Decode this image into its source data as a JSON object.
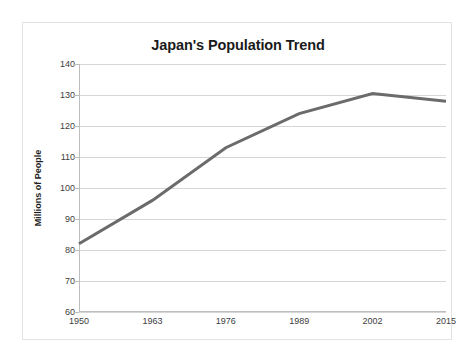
{
  "chart_data": {
    "type": "line",
    "title": "Japan's Population Trend",
    "xlabel": "",
    "ylabel": "Millions of People",
    "x": [
      1950,
      1963,
      1976,
      1989,
      2002,
      2015
    ],
    "categories": [
      "1950",
      "1963",
      "1976",
      "1989",
      "2002",
      "2015"
    ],
    "values": [
      82,
      96,
      113,
      124,
      130.5,
      128
    ],
    "series": [
      {
        "name": "Japan population",
        "values": [
          82,
          96,
          113,
          124,
          130.5,
          128
        ]
      }
    ],
    "xlim": [
      1950,
      2015
    ],
    "ylim": [
      60,
      140
    ],
    "yticks": [
      60,
      70,
      80,
      90,
      100,
      110,
      120,
      130,
      140
    ],
    "ytick_labels": [
      "60",
      "70",
      "80",
      "90",
      "100",
      "110",
      "120",
      "130",
      "140"
    ],
    "xticks": [
      1950,
      1963,
      1976,
      1989,
      2002,
      2015
    ],
    "xtick_labels": [
      "1950",
      "1963",
      "1976",
      "1989",
      "2002",
      "2015"
    ],
    "grid": "horizontal",
    "legend": "none",
    "line_color": "#6b6b6b",
    "line_width": 3,
    "grid_color": "#d6d6d6",
    "axis_color": "#bdbdbd",
    "title_color": "#1a1a1a",
    "background": "#ffffff",
    "border_color": "#e2e2e2"
  }
}
